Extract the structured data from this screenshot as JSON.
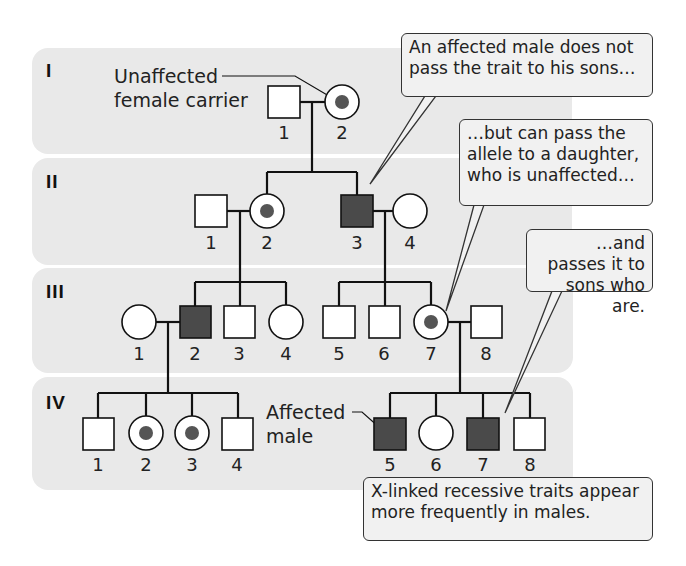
{
  "generations": [
    {
      "label": "I",
      "individuals": [
        {
          "id": "1",
          "sex": "male",
          "status": "unaffected"
        },
        {
          "id": "2",
          "sex": "female",
          "status": "carrier"
        }
      ]
    },
    {
      "label": "II",
      "individuals": [
        {
          "id": "1",
          "sex": "male",
          "status": "unaffected"
        },
        {
          "id": "2",
          "sex": "female",
          "status": "carrier"
        },
        {
          "id": "3",
          "sex": "male",
          "status": "affected"
        },
        {
          "id": "4",
          "sex": "female",
          "status": "unaffected"
        }
      ]
    },
    {
      "label": "III",
      "individuals": [
        {
          "id": "1",
          "sex": "female",
          "status": "unaffected"
        },
        {
          "id": "2",
          "sex": "male",
          "status": "affected"
        },
        {
          "id": "3",
          "sex": "male",
          "status": "unaffected"
        },
        {
          "id": "4",
          "sex": "female",
          "status": "unaffected"
        },
        {
          "id": "5",
          "sex": "male",
          "status": "unaffected"
        },
        {
          "id": "6",
          "sex": "male",
          "status": "unaffected"
        },
        {
          "id": "7",
          "sex": "female",
          "status": "carrier"
        },
        {
          "id": "8",
          "sex": "male",
          "status": "unaffected"
        }
      ]
    },
    {
      "label": "IV",
      "individuals": [
        {
          "id": "1",
          "sex": "male",
          "status": "unaffected"
        },
        {
          "id": "2",
          "sex": "female",
          "status": "carrier"
        },
        {
          "id": "3",
          "sex": "female",
          "status": "carrier"
        },
        {
          "id": "4",
          "sex": "male",
          "status": "unaffected"
        },
        {
          "id": "5",
          "sex": "male",
          "status": "affected"
        },
        {
          "id": "6",
          "sex": "female",
          "status": "unaffected"
        },
        {
          "id": "7",
          "sex": "male",
          "status": "affected"
        },
        {
          "id": "8",
          "sex": "male",
          "status": "unaffected"
        }
      ]
    }
  ],
  "labels": {
    "carrier_line1": "Unaffected",
    "carrier_line2": "female carrier",
    "affected_line1": "Affected",
    "affected_line2": "male"
  },
  "callouts": {
    "c1": "An affected male does not pass the trait to his sons…",
    "c2": "…but can pass the allele to a daughter, who is unaffected…",
    "c3": "…and passes it to sons who are.",
    "c4": "X-linked recessive traits appear more frequently in males."
  },
  "colors": {
    "band": "#e9e9e9",
    "affected_fill": "#4a4a4a",
    "carrier_dot": "#555555",
    "line": "#111111"
  }
}
